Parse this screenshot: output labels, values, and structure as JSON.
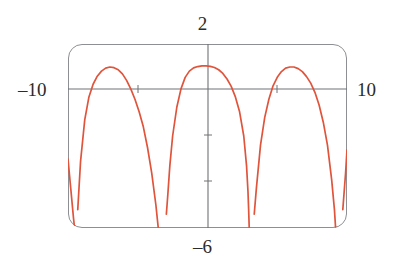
{
  "figure": {
    "kind": "graphing-calculator-plot",
    "background_color": "#ffffff",
    "frame_color": "#8d8f92",
    "axis_color": "#6f7276",
    "curve_color": "#e0543c",
    "label_color": "#2b2b2b"
  },
  "labels": {
    "y_max": "2",
    "y_min": "–6",
    "x_min": "–10",
    "x_max": "10"
  },
  "chart_data": {
    "type": "line",
    "title": "",
    "subtitle": "",
    "xlabel": "",
    "ylabel": "",
    "xlim": [
      -10,
      10
    ],
    "ylim": [
      -6,
      2
    ],
    "grid": false,
    "legend": null,
    "axis_style": "cross-hair axes through origin inside rounded frame",
    "x_tick_labels": [
      "–10",
      "10"
    ],
    "y_tick_labels": [
      "2",
      "–6"
    ],
    "x_ticks": [
      -5,
      5
    ],
    "y_ticks": [
      -2,
      -4
    ],
    "annotations": [
      "vertical asymptotes where the curve plunges to the bottom of the window",
      "three full arches visible plus partial arches clipped at both window edges"
    ],
    "asymptotes_x": [
      -9.5,
      -3.2,
      3.0,
      9.3
    ],
    "peaks": [
      {
        "x": -6.3,
        "y": 1.0
      },
      {
        "x": -0.1,
        "y": 1.05
      },
      {
        "x": 6.2,
        "y": 1.0
      }
    ],
    "series": [
      {
        "name": "curve",
        "color": "#e0543c",
        "description": "periodic arched curve with period about 6.28 (2π), maxima near y=1, dropping steeply to y=-6 at each asymptote",
        "x": [
          -10.0,
          -9.8,
          -9.6,
          -9.5,
          -9.45,
          -9.4,
          -9.3,
          -9.1,
          -8.8,
          -8.5,
          -8.2,
          -7.9,
          -7.6,
          -7.3,
          -7.0,
          -6.7,
          -6.4,
          -6.3,
          -6.1,
          -5.8,
          -5.5,
          -5.2,
          -4.9,
          -4.6,
          -4.3,
          -4.0,
          -3.7,
          -3.5,
          -3.35,
          -3.25,
          -3.2,
          -3.15,
          -3.05,
          -2.95,
          -2.85,
          -2.7,
          -2.5,
          -2.2,
          -1.9,
          -1.6,
          -1.3,
          -1.0,
          -0.7,
          -0.4,
          -0.1,
          0.2,
          0.5,
          0.8,
          1.1,
          1.4,
          1.7,
          2.0,
          2.3,
          2.6,
          2.8,
          2.9,
          2.95,
          3.0,
          3.05,
          3.1,
          3.2,
          3.35,
          3.5,
          3.8,
          4.1,
          4.4,
          4.7,
          5.0,
          5.3,
          5.6,
          5.9,
          6.2,
          6.5,
          6.8,
          7.1,
          7.4,
          7.7,
          8.0,
          8.3,
          8.6,
          8.9,
          9.1,
          9.2,
          9.3,
          9.4,
          9.5,
          9.7,
          9.9,
          10.0
        ],
        "y": [
          -3.0,
          -4.3,
          -5.6,
          -6.0,
          -6.0,
          -6.0,
          -5.2,
          -3.1,
          -1.3,
          -0.3,
          0.25,
          0.6,
          0.82,
          0.95,
          1.0,
          0.97,
          0.88,
          0.82,
          0.7,
          0.42,
          0.05,
          -0.4,
          -0.95,
          -1.6,
          -2.5,
          -3.6,
          -5.0,
          -6.0,
          -6.0,
          -6.0,
          -6.0,
          -6.0,
          -6.0,
          -5.4,
          -4.6,
          -3.3,
          -2.0,
          -0.75,
          0.05,
          0.55,
          0.82,
          0.96,
          1.02,
          1.05,
          1.05,
          1.03,
          0.98,
          0.88,
          0.72,
          0.48,
          0.16,
          -0.3,
          -0.95,
          -2.0,
          -3.3,
          -4.4,
          -5.2,
          -6.0,
          -6.0,
          -6.0,
          -6.0,
          -5.4,
          -4.3,
          -2.4,
          -1.2,
          -0.4,
          0.18,
          0.55,
          0.8,
          0.95,
          1.0,
          1.0,
          0.93,
          0.8,
          0.58,
          0.3,
          -0.1,
          -0.65,
          -1.4,
          -2.4,
          -3.9,
          -5.2,
          -6.0,
          -6.0,
          -6.0,
          -6.0,
          -5.2,
          -3.6,
          -2.6
        ]
      }
    ]
  }
}
